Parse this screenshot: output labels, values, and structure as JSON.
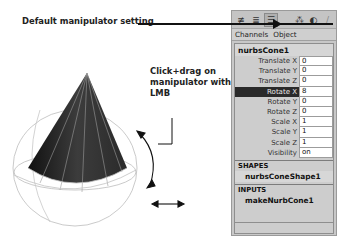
{
  "callouts": {
    "default_manipulator": "Default manipulator setting",
    "click_drag_line1": "Click+drag on",
    "click_drag_line2": "manipulator with LMB"
  },
  "toolbar": {
    "left_buttons": [
      {
        "icon": "channel-box-layout-icon",
        "glyph": "≢"
      },
      {
        "icon": "attribute-layout-icon",
        "glyph": "≣"
      },
      {
        "icon": "channel-layer-icon",
        "glyph": "☰",
        "active": true
      }
    ],
    "right_buttons": [
      {
        "icon": "manipulator-default-icon",
        "glyph": "⁂"
      },
      {
        "icon": "manipulator-slider-icon",
        "glyph": "◐"
      },
      {
        "icon": "manipulator-no-icon",
        "glyph": "/"
      }
    ]
  },
  "menubar": {
    "items": [
      "Channels",
      "Object"
    ]
  },
  "channel_box": {
    "node_name": "nurbsCone1",
    "attributes": [
      {
        "label": "Translate X",
        "value": "0"
      },
      {
        "label": "Translate Y",
        "value": "0"
      },
      {
        "label": "Translate Z",
        "value": "0"
      },
      {
        "label": "Rotate X",
        "value": "8",
        "selected": true
      },
      {
        "label": "Rotate Y",
        "value": "0"
      },
      {
        "label": "Rotate Z",
        "value": "0"
      },
      {
        "label": "Scale X",
        "value": "1"
      },
      {
        "label": "Scale Y",
        "value": "1"
      },
      {
        "label": "Scale Z",
        "value": "1"
      },
      {
        "label": "Visibility",
        "value": "on"
      }
    ],
    "shapes": {
      "header": "SHAPES",
      "items": [
        "nurbsConeShape1"
      ]
    },
    "inputs": {
      "header": "INPUTS",
      "items": [
        "makeNurbCone1"
      ]
    }
  },
  "viewport": {
    "object": "nurbsCone1",
    "colors": {
      "cone_dark": "#1e1e1e",
      "cone_mid": "#3a3a3a",
      "manipulator_ring": "#b4b4b4"
    }
  }
}
